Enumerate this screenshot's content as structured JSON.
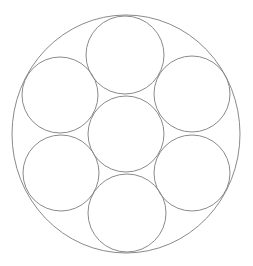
{
  "diagram": {
    "type": "circle-packing",
    "stroke_color": "#8a8a8a",
    "background": "#ffffff",
    "outer_circle": {
      "cx": 126,
      "cy": 134,
      "rx": 114,
      "ry": 119
    },
    "inner_circles": [
      {
        "name": "center",
        "cx": 126,
        "cy": 134,
        "r": 38
      },
      {
        "name": "top",
        "cx": 125,
        "cy": 55,
        "r": 39
      },
      {
        "name": "upper-right",
        "cx": 192,
        "cy": 94,
        "r": 38
      },
      {
        "name": "lower-right",
        "cx": 192,
        "cy": 173,
        "r": 38
      },
      {
        "name": "bottom",
        "cx": 127,
        "cy": 213,
        "r": 39
      },
      {
        "name": "lower-left",
        "cx": 61,
        "cy": 173,
        "r": 38
      },
      {
        "name": "upper-left",
        "cx": 60,
        "cy": 95,
        "r": 38
      }
    ]
  }
}
